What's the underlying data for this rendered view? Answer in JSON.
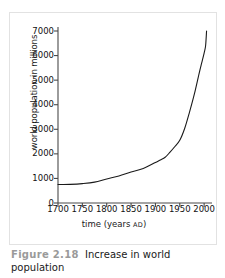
{
  "caption": {
    "figure_number": "Figure 2.18",
    "title": "Increase in world population"
  },
  "chart_data": {
    "type": "line",
    "title": "",
    "xlabel": "time (years AD)",
    "xlabel_main": "time (years",
    "xlabel_smallcaps": "AD",
    "xlabel_close": ")",
    "ylabel": "world population in millions",
    "xlim": [
      1700,
      2010
    ],
    "ylim": [
      0,
      7000
    ],
    "xticks": [
      1700,
      1750,
      1800,
      1850,
      1900,
      1950,
      2000
    ],
    "yticks": [
      0,
      1000,
      2000,
      3000,
      4000,
      5000,
      6000,
      7000
    ],
    "grid": false,
    "legend": false,
    "line_color": "#1a1a1a",
    "series": [
      {
        "name": "world population",
        "x": [
          1700,
          1725,
          1750,
          1775,
          1800,
          1825,
          1850,
          1875,
          1900,
          1910,
          1920,
          1930,
          1940,
          1950,
          1960,
          1970,
          1980,
          1990,
          1995,
          2000,
          2003,
          2005
        ],
        "values": [
          750,
          760,
          790,
          850,
          980,
          1100,
          1260,
          1400,
          1650,
          1750,
          1860,
          2070,
          2300,
          2550,
          3030,
          3700,
          4440,
          5300,
          5700,
          6100,
          6400,
          7000
        ]
      }
    ]
  },
  "axis": {
    "y_tick_labels": [
      "7000",
      "6000",
      "5000",
      "4000",
      "3000",
      "2000",
      "1000",
      "0"
    ],
    "x_tick_labels": [
      "1700",
      "1750",
      "1800",
      "1850",
      "1900",
      "1950",
      "2000"
    ]
  }
}
